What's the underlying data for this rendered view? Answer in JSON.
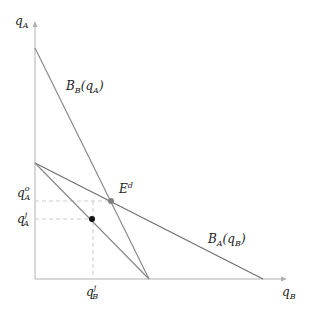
{
  "diagram": {
    "axes": {
      "y_label": "q",
      "y_label_sub": "A",
      "x_label": "q",
      "x_label_sub": "B"
    },
    "curves": [
      {
        "name": "B",
        "sub": "B",
        "arg": "(q",
        "arg_sub": "A",
        "close": ")"
      },
      {
        "name": "B",
        "sub": "A",
        "arg": "(q",
        "arg_sub": "B",
        "close": ")"
      }
    ],
    "points": {
      "equilibrium": {
        "label": "E",
        "sup": "d",
        "color": "#808080"
      },
      "joint": {
        "color": "#111111"
      }
    },
    "ticks": {
      "y_upper": {
        "base": "q",
        "sup": "o",
        "sub": "A"
      },
      "y_lower": {
        "base": "q",
        "sup": "j",
        "sub": "A"
      },
      "x": {
        "base": "q",
        "sup": "j",
        "sub": "B"
      }
    },
    "colors": {
      "axis": "#b0b0b0",
      "line": "#8a8a8a",
      "dash": "#cccccc"
    }
  }
}
